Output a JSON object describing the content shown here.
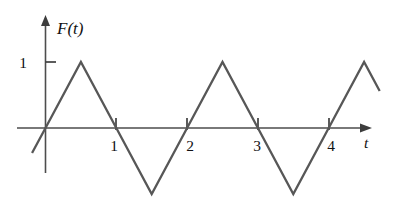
{
  "figure": {
    "title": "",
    "background_color": "#ffffff",
    "line_color": "#575757",
    "axis_color": "#4d4d4d",
    "text_color": "#111111"
  },
  "labels": {
    "y_axis_name": "F(t)",
    "x_axis_name": "t",
    "y_tick_1": "1",
    "x_tick_1": "1",
    "x_tick_2": "2",
    "x_tick_3": "3",
    "x_tick_4": "4"
  },
  "chart_data": {
    "type": "line",
    "title": "",
    "subtitle": "",
    "xlabel": "t",
    "ylabel": "F(t)",
    "xlim": [
      -0.38,
      4.55
    ],
    "ylim": [
      -1.0,
      1.12
    ],
    "grid": false,
    "legend": null,
    "annotations": [],
    "x_ticks": [
      1,
      2,
      3,
      4
    ],
    "x_tick_labels": [
      "1",
      "2",
      "3",
      "4"
    ],
    "y_ticks": [
      1
    ],
    "y_tick_labels": [
      "1"
    ],
    "series": [
      {
        "name": "F(t)",
        "color": "#575757",
        "x": [
          -0.19,
          0,
          0.5,
          1,
          1.5,
          2,
          2.5,
          3,
          3.5,
          4,
          4.5,
          4.72
        ],
        "y": [
          -0.38,
          0,
          1,
          0,
          -1,
          0,
          1,
          0,
          -1,
          0,
          1,
          0.56
        ]
      }
    ]
  }
}
